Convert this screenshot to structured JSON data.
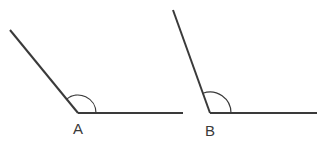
{
  "diagram": {
    "type": "angle-comparison",
    "stroke_color": "#3a3a3a",
    "angles": [
      {
        "label": "A",
        "vertex": [
          78,
          113
        ],
        "ray_end_upper": [
          10,
          30
        ],
        "ray_end_horizontal": [
          183,
          113
        ],
        "arc_radius": 18
      },
      {
        "label": "B",
        "vertex": [
          210,
          113
        ],
        "ray_end_upper": [
          173,
          10
        ],
        "ray_end_horizontal": [
          317,
          113
        ],
        "arc_radius": 21
      }
    ]
  }
}
